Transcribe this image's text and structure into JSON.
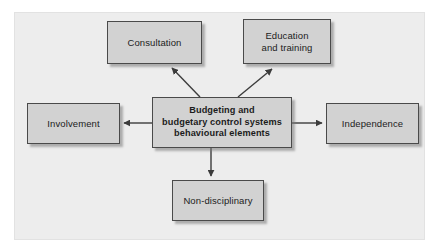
{
  "diagram": {
    "title": "Budgeting and budgetary control systems behavioural elements",
    "panel_background": "#ededed",
    "node_fill": "#d2d2d2",
    "node_border": "#4a4a4a",
    "connector_color": "#3c3c3c",
    "text_color": "#1c1c1c"
  },
  "nodes": {
    "center": {
      "line1": "Budgeting and",
      "line2": "budgetary control systems",
      "line3": "behavioural elements"
    },
    "consultation": {
      "label": "Consultation"
    },
    "education": {
      "line1": "Education",
      "line2": "and training"
    },
    "involvement": {
      "label": "Involvement"
    },
    "independence": {
      "label": "Independence"
    },
    "nondisciplinary": {
      "label": "Non-disciplinary"
    }
  },
  "connectors": [
    {
      "name": "center-to-consultation",
      "from": "center",
      "to": "consultation",
      "direction": "up-left",
      "arrowhead": "to"
    },
    {
      "name": "center-to-education",
      "from": "center",
      "to": "education",
      "direction": "up-right",
      "arrowhead": "to"
    },
    {
      "name": "center-to-involvement",
      "from": "center",
      "to": "involvement",
      "direction": "left",
      "arrowhead": "to"
    },
    {
      "name": "center-to-independence",
      "from": "center",
      "to": "independence",
      "direction": "right",
      "arrowhead": "to"
    },
    {
      "name": "center-to-nondisciplinary",
      "from": "center",
      "to": "nondisciplinary",
      "direction": "down",
      "arrowhead": "to"
    }
  ]
}
